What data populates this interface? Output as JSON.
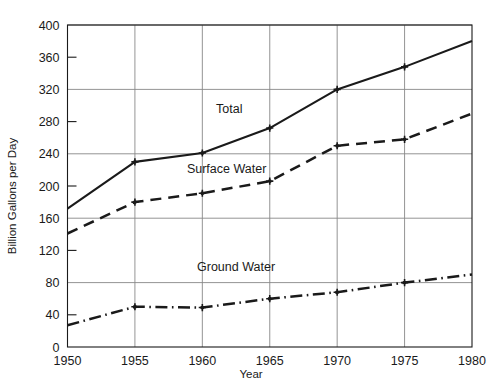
{
  "chart_data": {
    "type": "line",
    "title": "",
    "xlabel": "Year",
    "ylabel": "Billion Gallons per Day",
    "x": [
      1950,
      1955,
      1960,
      1965,
      1970,
      1975,
      1980
    ],
    "xtick_labels": [
      "1950",
      "1955",
      "1960",
      "1965",
      "1970",
      "1975",
      "1980"
    ],
    "ytick_labels": [
      "0",
      "40",
      "80",
      "120",
      "160",
      "200",
      "240",
      "280",
      "320",
      "360",
      "400"
    ],
    "ytick_values": [
      0,
      40,
      80,
      120,
      160,
      200,
      240,
      280,
      320,
      360,
      400
    ],
    "ygrid_values": [
      80,
      160,
      240,
      320,
      400
    ],
    "yminor_tick_values": [
      40,
      120,
      200,
      280,
      360
    ],
    "xlim": [
      1950,
      1980
    ],
    "ylim": [
      0,
      400
    ],
    "grid": true,
    "legend": "inline-annotations",
    "series": [
      {
        "name": "Total",
        "style": "solid",
        "color": "#1a1a1a",
        "values": [
          172,
          230,
          241,
          272,
          320,
          348,
          380
        ],
        "label_x": 1962.0,
        "label_y": 291
      },
      {
        "name": "Surface Water",
        "style": "dashed",
        "color": "#1a1a1a",
        "values": [
          141,
          180,
          191,
          206,
          250,
          258,
          290
        ],
        "label_x": 1961.8,
        "label_y": 216
      },
      {
        "name": "Ground Water",
        "style": "dash-dot",
        "color": "#1a1a1a",
        "values": [
          27,
          50,
          49,
          60,
          68,
          80,
          90
        ],
        "label_x": 1962.5,
        "label_y": 94
      }
    ]
  }
}
